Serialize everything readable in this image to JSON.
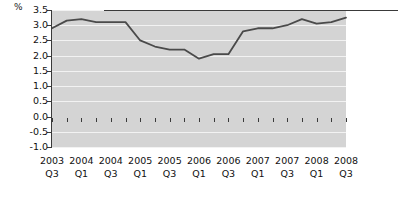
{
  "chart_data": {
    "type": "line",
    "title": "",
    "xlabel": "",
    "ylabel": "%",
    "ylim": [
      -1.0,
      3.5
    ],
    "ytick_labels": [
      "3.5",
      "3.0",
      "2.5",
      "2.0",
      "1.5",
      "1.0",
      "0.5",
      "0.0",
      "-0.5",
      "-1.0"
    ],
    "ytick_values": [
      3.5,
      3.0,
      2.5,
      2.0,
      1.5,
      1.0,
      0.5,
      0.0,
      -0.5,
      -1.0
    ],
    "grid": true,
    "legend": "none",
    "categories": [
      "2003 Q3",
      "2003 Q4",
      "2004 Q1",
      "2004 Q2",
      "2004 Q3",
      "2004 Q4",
      "2005 Q1",
      "2005 Q2",
      "2005 Q3",
      "2005 Q4",
      "2006 Q1",
      "2006 Q2",
      "2006 Q3",
      "2006 Q4",
      "2007 Q1",
      "2007 Q2",
      "2007 Q3",
      "2007 Q4",
      "2008 Q1",
      "2008 Q2",
      "2008 Q3"
    ],
    "xtick_labels": [
      {
        "year": "2003",
        "quarter": "Q3"
      },
      {
        "year": "2004",
        "quarter": "Q1"
      },
      {
        "year": "2004",
        "quarter": "Q3"
      },
      {
        "year": "2005",
        "quarter": "Q1"
      },
      {
        "year": "2005",
        "quarter": "Q3"
      },
      {
        "year": "2006",
        "quarter": "Q1"
      },
      {
        "year": "2006",
        "quarter": "Q3"
      },
      {
        "year": "2007",
        "quarter": "Q1"
      },
      {
        "year": "2007",
        "quarter": "Q3"
      },
      {
        "year": "2008",
        "quarter": "Q1"
      },
      {
        "year": "2008",
        "quarter": "Q3"
      }
    ],
    "values": [
      2.9,
      3.15,
      3.2,
      3.1,
      3.1,
      3.1,
      2.5,
      2.3,
      2.2,
      2.2,
      1.9,
      2.05,
      2.05,
      2.8,
      2.9,
      2.9,
      3.0,
      3.2,
      3.05,
      3.1,
      3.25
    ],
    "values_tail": [
      3.25,
      2.9,
      2.0,
      0.4
    ],
    "series_color": "#4a4a4a",
    "plot_background": "#d4d4d4",
    "gridline_color": "#f2f2f2",
    "axis_color": "#3a3a3a"
  }
}
